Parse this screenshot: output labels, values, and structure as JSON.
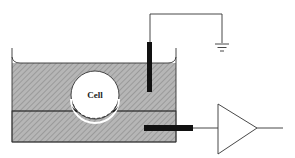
{
  "diagram": {
    "type": "patch-clamp-setup",
    "cell_label": "Cell",
    "components": [
      "bath",
      "cell",
      "reference-electrode",
      "ground",
      "recording-electrode",
      "amplifier"
    ],
    "colors": {
      "bath_fill": "#b4b4b4",
      "hatch": "#8a8a8a",
      "stroke": "#333333",
      "electrode": "#111111",
      "cell_fill": "#ffffff"
    }
  }
}
